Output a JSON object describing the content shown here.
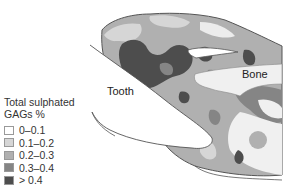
{
  "legend": {
    "title_line1": "Total sulphated",
    "title_line2": "GAGs %",
    "items": [
      {
        "label": "0–0.1",
        "color": "#ffffff"
      },
      {
        "label": "0.1–0.2",
        "color": "#d6d6d6"
      },
      {
        "label": "0.2–0.3",
        "color": "#b0b0b0"
      },
      {
        "label": "0.3–0.4",
        "color": "#858585"
      },
      {
        "label": "> 0.4",
        "color": "#4d4d4d"
      }
    ]
  },
  "labels": {
    "tooth": "Tooth",
    "bone": "Bone"
  },
  "colors": {
    "outline": "#555555",
    "bone_fill": "#f0f0f0",
    "tooth_fill": "#ffffff"
  }
}
